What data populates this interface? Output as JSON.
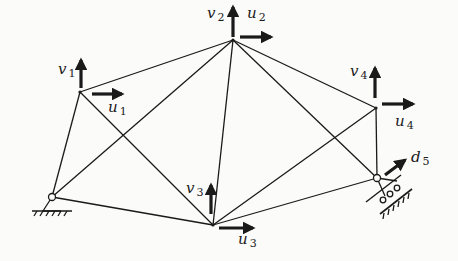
{
  "diagram": {
    "type": "truss",
    "colors": {
      "line": "#1a1a1a",
      "background": "#fbfbfa"
    },
    "nodes": [
      {
        "id": "A",
        "x": 52,
        "y": 197,
        "support": "pin"
      },
      {
        "id": "1",
        "x": 80,
        "y": 92
      },
      {
        "id": "2",
        "x": 233,
        "y": 40
      },
      {
        "id": "3",
        "x": 213,
        "y": 225
      },
      {
        "id": "4",
        "x": 376,
        "y": 108
      },
      {
        "id": "5",
        "x": 377,
        "y": 178,
        "support": "inclined-roller"
      }
    ],
    "members": [
      [
        "A",
        "1"
      ],
      [
        "A",
        "2"
      ],
      [
        "A",
        "3"
      ],
      [
        "1",
        "2"
      ],
      [
        "1",
        "3"
      ],
      [
        "2",
        "3"
      ],
      [
        "2",
        "4"
      ],
      [
        "2",
        "5"
      ],
      [
        "3",
        "4"
      ],
      [
        "3",
        "5"
      ],
      [
        "4",
        "5"
      ]
    ],
    "labels": [
      {
        "id": "v1",
        "sym": "v",
        "sub": "1",
        "x": 58,
        "y": 66
      },
      {
        "id": "u1",
        "sym": "u",
        "sub": "1",
        "x": 108,
        "y": 100
      },
      {
        "id": "v2",
        "sym": "v",
        "sub": "2",
        "x": 208,
        "y": 10
      },
      {
        "id": "u2",
        "sym": "u",
        "sub": "2",
        "x": 247,
        "y": 10
      },
      {
        "id": "v3",
        "sym": "v",
        "sub": "3",
        "x": 186,
        "y": 183
      },
      {
        "id": "u3",
        "sym": "u",
        "sub": "3",
        "x": 238,
        "y": 232
      },
      {
        "id": "v4",
        "sym": "v",
        "sub": "4",
        "x": 350,
        "y": 66
      },
      {
        "id": "u4",
        "sym": "u",
        "sub": "4",
        "x": 395,
        "y": 120
      },
      {
        "id": "d5",
        "sym": "d",
        "sub": "5",
        "x": 410,
        "y": 153
      }
    ]
  }
}
